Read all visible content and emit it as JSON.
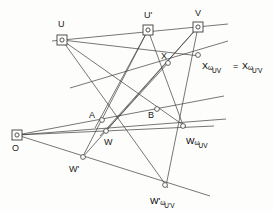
{
  "figure": {
    "background_color": "#fdfdfb",
    "line_color": "#3c3c3c",
    "text_color": "#1a1a1a",
    "width": 274,
    "height": 211,
    "points": [
      {
        "id": "O",
        "label": "O",
        "x": 17,
        "y": 135,
        "marker": "square-dot"
      },
      {
        "id": "U",
        "label": "U",
        "x": 62,
        "y": 40,
        "marker": "square-dot"
      },
      {
        "id": "Uprime",
        "label": "U'",
        "x": 148,
        "y": 30,
        "marker": "square-dot"
      },
      {
        "id": "V",
        "label": "V",
        "x": 198,
        "y": 27,
        "marker": "square-dot"
      },
      {
        "id": "A",
        "label": "A",
        "x": 102,
        "y": 120,
        "marker": "circle"
      },
      {
        "id": "B",
        "label": "B",
        "x": 157,
        "y": 109,
        "marker": "circle"
      },
      {
        "id": "W",
        "label": "W",
        "x": 106,
        "y": 131,
        "marker": "circle"
      },
      {
        "id": "Wprime",
        "label": "W'",
        "x": 83,
        "y": 157,
        "marker": "circle"
      },
      {
        "id": "X",
        "label": "X",
        "x": 168,
        "y": 63,
        "marker": "circle"
      },
      {
        "id": "Xw",
        "label": "",
        "x": 198,
        "y": 55,
        "marker": "circle"
      },
      {
        "id": "Ww",
        "label": "",
        "x": 183,
        "y": 126,
        "marker": "circle"
      },
      {
        "id": "Wpw",
        "label": "",
        "x": 165,
        "y": 185,
        "marker": "circle"
      }
    ],
    "labels": [
      {
        "name": "label-O",
        "text": "O",
        "x": 12,
        "y": 144
      },
      {
        "name": "label-U",
        "text": "U",
        "x": 58,
        "y": 20
      },
      {
        "name": "label-U-prime",
        "text": "U'",
        "x": 144,
        "y": 11
      },
      {
        "name": "label-V",
        "text": "V",
        "x": 195,
        "y": 9
      },
      {
        "name": "label-A",
        "text": "A",
        "x": 89,
        "y": 111
      },
      {
        "name": "label-B",
        "text": "B",
        "x": 148,
        "y": 111
      },
      {
        "name": "label-W",
        "text": "W",
        "x": 104,
        "y": 138
      },
      {
        "name": "label-W-prime",
        "text": "W'",
        "x": 69,
        "y": 165
      },
      {
        "name": "label-X",
        "text": "X",
        "x": 161,
        "y": 52
      }
    ],
    "composite_labels": [
      {
        "name": "label-X-omega-UV",
        "x": 202,
        "y": 55,
        "base": "X",
        "omega": "ω",
        "sub": "UV"
      },
      {
        "name": "label-equals",
        "x": 233,
        "y": 55,
        "base": "=",
        "omega": "",
        "sub": ""
      },
      {
        "name": "label-X-omega-U-prime-V",
        "x": 242,
        "y": 55,
        "base": "X",
        "omega": "ω",
        "sub": "U'V"
      },
      {
        "name": "label-W-omega-UV",
        "x": 186,
        "y": 130,
        "base": "W",
        "omega": "ω",
        "sub": "UV"
      },
      {
        "name": "label-W-prime-omega-U-prime-V",
        "x": 150,
        "y": 190,
        "base": "W'",
        "omega": "ω",
        "sub": "U'V"
      }
    ],
    "lines": [
      {
        "name": "line-top-UUprimeV",
        "x1": 52,
        "y1": 41,
        "x2": 228,
        "y2": 24
      },
      {
        "name": "line-X-axis",
        "x1": 70,
        "y1": 88,
        "x2": 228,
        "y2": 41
      },
      {
        "name": "line-mid-horizon",
        "x1": 17,
        "y1": 135,
        "x2": 224,
        "y2": 96
      },
      {
        "name": "line-O-through-A",
        "x1": 17,
        "y1": 135,
        "x2": 226,
        "y2": 119
      },
      {
        "name": "line-O-through-W",
        "x1": 17,
        "y1": 135,
        "x2": 214,
        "y2": 126
      },
      {
        "name": "line-O-through-Wprime",
        "x1": 17,
        "y1": 135,
        "x2": 210,
        "y2": 196
      },
      {
        "name": "line-U-to-Wprime-omega",
        "x1": 62,
        "y1": 40,
        "x2": 168,
        "y2": 188
      },
      {
        "name": "line-U-to-W-omega",
        "x1": 62,
        "y1": 40,
        "x2": 186,
        "y2": 127
      },
      {
        "name": "line-U-to-X-omega",
        "x1": 62,
        "y1": 40,
        "x2": 200,
        "y2": 56
      },
      {
        "name": "line-Uprime-to-Wprime",
        "x1": 148,
        "y1": 30,
        "x2": 82,
        "y2": 158
      },
      {
        "name": "line-Uprime-to-A",
        "x1": 148,
        "y1": 30,
        "x2": 95,
        "y2": 128
      },
      {
        "name": "line-Uprime-to-Bproj",
        "x1": 148,
        "y1": 30,
        "x2": 184,
        "y2": 128
      },
      {
        "name": "line-V-to-Wprime",
        "x1": 198,
        "y1": 27,
        "x2": 82,
        "y2": 158
      },
      {
        "name": "line-V-to-W",
        "x1": 198,
        "y1": 27,
        "x2": 100,
        "y2": 136
      },
      {
        "name": "line-V-to-Wprime-omega",
        "x1": 198,
        "y1": 27,
        "x2": 166,
        "y2": 186
      },
      {
        "name": "line-X-to-W",
        "x1": 168,
        "y1": 63,
        "x2": 104,
        "y2": 133
      }
    ]
  }
}
